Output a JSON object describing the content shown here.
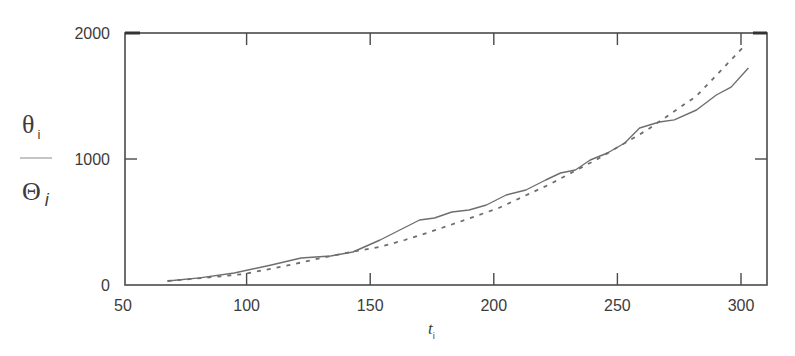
{
  "chart_data": {
    "type": "line",
    "title": "",
    "xlabel": "t_i",
    "ylabel": "θ_i / Θ_i",
    "xlim": [
      50,
      310
    ],
    "ylim": [
      0,
      2000
    ],
    "xticks": [
      50,
      100,
      150,
      200,
      250,
      300
    ],
    "yticks": [
      0,
      1000,
      2000
    ],
    "grid": false,
    "legend_position": "left (as y-axis label: solid line = θ_i, dotted line = Θ_i)",
    "series": [
      {
        "name": "θ_i",
        "style": "solid",
        "color": "#6e6e6e",
        "x": [
          68,
          81,
          95,
          110,
          122,
          134,
          143,
          154,
          170,
          176,
          183,
          190,
          197,
          205,
          213,
          221,
          227,
          233,
          239,
          246,
          253,
          259,
          267,
          273,
          282,
          290,
          296,
          303
        ],
        "values": [
          32,
          56,
          95,
          159,
          214,
          230,
          262,
          357,
          516,
          532,
          579,
          595,
          635,
          714,
          754,
          833,
          889,
          913,
          992,
          1048,
          1127,
          1246,
          1294,
          1310,
          1389,
          1508,
          1571,
          1722
        ]
      },
      {
        "name": "Θ_i",
        "style": "dotted",
        "color": "#6e6e6e",
        "x": [
          68,
          85,
          99,
          118,
          130,
          142,
          154,
          164,
          174,
          186,
          202,
          222,
          242,
          262,
          282,
          301
        ],
        "values": [
          32,
          60,
          87,
          160,
          214,
          262,
          302,
          357,
          420,
          500,
          611,
          794,
          1000,
          1230,
          1500,
          1890
        ]
      }
    ]
  },
  "axes": {
    "x_tick_labels": [
      "50",
      "100",
      "150",
      "200",
      "250",
      "300"
    ],
    "y_tick_labels": [
      "0",
      "1000",
      "2000"
    ],
    "x_label": {
      "var": "t",
      "sub": "i"
    },
    "y_label_top": {
      "var": "θ",
      "sub": "i"
    },
    "y_label_bottom": {
      "var": "Θ",
      "sub": "i"
    }
  }
}
